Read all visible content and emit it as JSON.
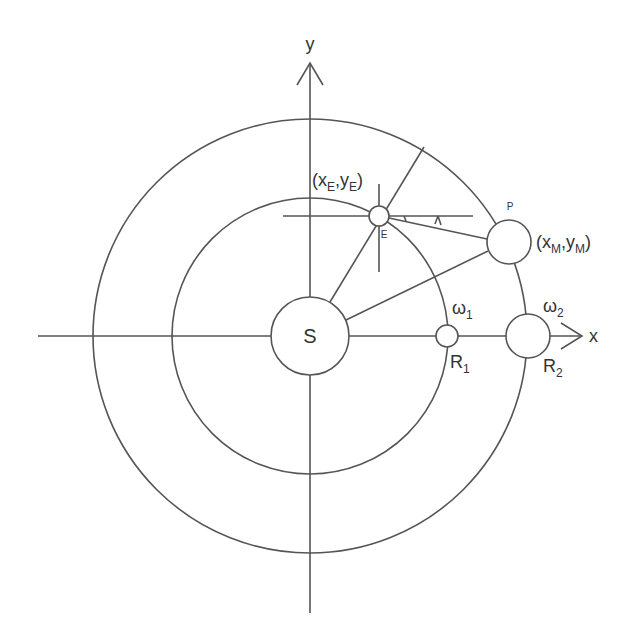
{
  "diagram": {
    "colors": {
      "stroke": "#555555",
      "text": "#333333",
      "background": "#ffffff"
    },
    "axes": {
      "x_label": "x",
      "y_label": "y"
    },
    "sun": {
      "label": "S"
    },
    "earth": {
      "label": "E",
      "coord_open": "(x",
      "coord_sub1": "E",
      "coord_mid": ",y",
      "coord_sub2": "E",
      "coord_close": ")"
    },
    "mars": {
      "label": "P",
      "coord_open": "(x",
      "coord_sub1": "M",
      "coord_mid": ",y",
      "coord_sub2": "M",
      "coord_close": ")"
    },
    "inner_orbit": {
      "omega_label": "ω",
      "omega_sub": "1",
      "radius_label": "R",
      "radius_sub": "1"
    },
    "outer_orbit": {
      "omega_label": "ω",
      "omega_sub": "2",
      "radius_label": "R",
      "radius_sub": "2"
    },
    "angle_marker": "λ"
  }
}
